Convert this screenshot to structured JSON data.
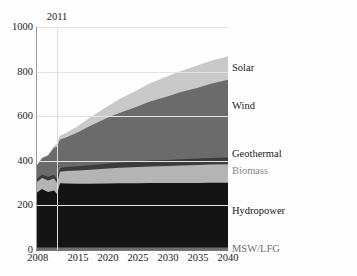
{
  "chart_data": {
    "type": "area",
    "stacked": true,
    "title": "",
    "subtitle": "",
    "xlabel": "",
    "ylabel": "",
    "xlim": [
      2008,
      2040
    ],
    "ylim": [
      0,
      1000
    ],
    "grid": true,
    "legend_position": "right-inline",
    "x_tick_labels": [
      "2008",
      "2015",
      "2020",
      "2025",
      "2030",
      "2035",
      "2040"
    ],
    "x_ticks": [
      2008,
      2015,
      2020,
      2025,
      2030,
      2035,
      2040
    ],
    "y_tick_labels": [
      "0",
      "200",
      "400",
      "600",
      "800",
      "1000"
    ],
    "y_ticks": [
      0,
      200,
      400,
      600,
      800,
      1000
    ],
    "annotations": [
      {
        "label": "2011",
        "x": 2011.5,
        "type": "vertical-line"
      }
    ],
    "x": [
      2008,
      2009,
      2010,
      2011,
      2011.5,
      2012,
      2013,
      2015,
      2017,
      2020,
      2022,
      2025,
      2027,
      2030,
      2032,
      2035,
      2037,
      2040
    ],
    "series": [
      {
        "name": "MSW/LFG",
        "color": "#6e6e6e",
        "label_color": "#6e6e6e",
        "values": [
          11,
          11,
          11,
          11,
          11,
          11,
          11,
          11,
          11,
          11,
          11,
          11,
          11,
          11,
          11,
          11,
          11,
          11
        ]
      },
      {
        "name": "Hydropower",
        "color": "#141414",
        "label_color": "#141414",
        "values": [
          243,
          262,
          249,
          256,
          240,
          288,
          287,
          286,
          286,
          287,
          288,
          288,
          289,
          289,
          290,
          290,
          291,
          291
        ]
      },
      {
        "name": "Biomass",
        "color": "#b4b4b4",
        "label_color": "#8a8a8a",
        "values": [
          48,
          50,
          52,
          54,
          50,
          52,
          56,
          60,
          63,
          68,
          70,
          73,
          75,
          77,
          78,
          80,
          81,
          82
        ]
      },
      {
        "name": "Geothermal",
        "color": "#3b3b3b",
        "label_color": "#1a1a1a",
        "values": [
          15,
          16,
          16,
          17,
          16,
          17,
          18,
          19,
          20,
          22,
          23,
          25,
          26,
          27,
          28,
          29,
          30,
          31
        ]
      },
      {
        "name": "Wind",
        "color": "#6b6b6b",
        "label_color": "#1a1a1a",
        "values": [
          56,
          72,
          95,
          120,
          146,
          128,
          133,
          152,
          176,
          206,
          224,
          248,
          265,
          286,
          300,
          318,
          331,
          348
        ]
      },
      {
        "name": "Solar",
        "color": "#c9c9c9",
        "label_color": "#1a1a1a",
        "values": [
          2,
          3,
          5,
          8,
          14,
          16,
          20,
          28,
          38,
          52,
          62,
          74,
          82,
          90,
          95,
          100,
          103,
          106
        ]
      }
    ],
    "series_label_positions": [
      {
        "name": "Solar",
        "top": 62
      },
      {
        "name": "Wind",
        "top": 100
      },
      {
        "name": "Geothermal",
        "top": 148
      },
      {
        "name": "Biomass",
        "top": 165
      },
      {
        "name": "Hydropower",
        "top": 205
      },
      {
        "name": "MSW/LFG",
        "top": 243
      }
    ]
  }
}
